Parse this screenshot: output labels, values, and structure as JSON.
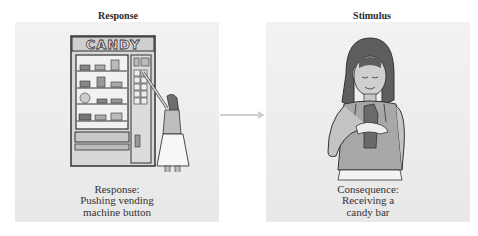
{
  "left_panel": {
    "title": "Response",
    "illustration": "vending-machine-girl-pushing-button",
    "machine_sign": "CANDY",
    "caption": [
      "Response:",
      "Pushing vending",
      "machine button"
    ]
  },
  "right_panel": {
    "title": "Stimulus",
    "illustration": "girl-holding-candy-bar",
    "caption": [
      "Consequence:",
      "Receiving a",
      "candy bar"
    ]
  },
  "connector": {
    "icon": "arrow-right-icon",
    "color": "#cfcfcf"
  },
  "colors": {
    "panel_bg": "#ececec",
    "text": "#2a2a2a"
  }
}
